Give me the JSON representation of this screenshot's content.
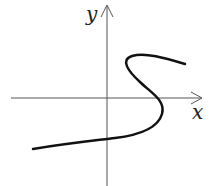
{
  "axes": {
    "x_label": "x",
    "y_label": "y"
  },
  "curve": {
    "description": "S-shaped curve crossing the x-axis once at positive x",
    "color": "#111111"
  },
  "colors": {
    "axis": "#555555",
    "background": "#ffffff"
  }
}
